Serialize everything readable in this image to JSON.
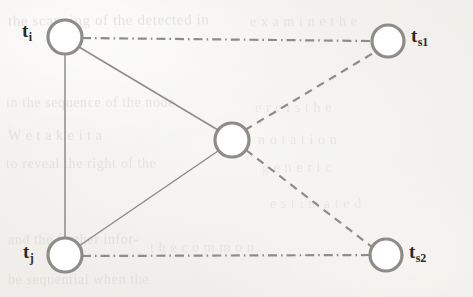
{
  "figure": {
    "type": "node-link-diagram",
    "caption_present": false,
    "background_color": "#f4f3f0",
    "stroke_color": "#8d8c89",
    "node_fill_color": "#ffffff",
    "label_color": "#2b2b2b",
    "width": 473,
    "height": 297
  },
  "nodes": [
    {
      "id": "t_i",
      "label_base": "t",
      "label_sub": "i",
      "label_text": "ti",
      "label_position": "left",
      "cx": 65,
      "cy": 37,
      "r": 17,
      "label_x": 22,
      "label_y": 21
    },
    {
      "id": "t_s1",
      "label_base": "t",
      "label_sub": "s1",
      "label_text": "ts1",
      "label_position": "right",
      "cx": 388,
      "cy": 41,
      "r": 16,
      "label_x": 411,
      "label_y": 26
    },
    {
      "id": "t_j",
      "label_base": "t",
      "label_sub": "j",
      "label_text": "tj",
      "label_position": "left",
      "cx": 65,
      "cy": 255,
      "r": 17,
      "label_x": 23,
      "label_y": 242
    },
    {
      "id": "t_s2",
      "label_base": "t",
      "label_sub": "s2",
      "label_text": "ts2",
      "label_position": "right",
      "cx": 386,
      "cy": 255,
      "r": 16,
      "label_x": 409,
      "label_y": 242
    },
    {
      "id": "center",
      "label_base": "",
      "label_sub": "",
      "label_text": "",
      "label_position": "none",
      "cx": 232,
      "cy": 140,
      "r": 17,
      "label_x": 0,
      "label_y": 0
    }
  ],
  "edges": [
    {
      "id": "edge-ti-tj",
      "from": "t_i",
      "to": "t_j",
      "style": "solid",
      "x1": 65,
      "y1": 54,
      "x2": 65,
      "y2": 238
    },
    {
      "id": "edge-ti-center",
      "from": "t_i",
      "to": "center",
      "style": "solid",
      "x1": 79,
      "y1": 47,
      "x2": 218,
      "y2": 130
    },
    {
      "id": "edge-tj-center",
      "from": "t_j",
      "to": "center",
      "style": "solid",
      "x1": 79,
      "y1": 246,
      "x2": 218,
      "y2": 151
    },
    {
      "id": "edge-ti-ts1",
      "from": "t_i",
      "to": "t_s1",
      "style": "dash-dot",
      "x1": 82,
      "y1": 38,
      "x2": 372,
      "y2": 41
    },
    {
      "id": "edge-tj-ts2",
      "from": "t_j",
      "to": "t_s2",
      "style": "dash-dot",
      "x1": 82,
      "y1": 256,
      "x2": 370,
      "y2": 255
    },
    {
      "id": "edge-center-ts1",
      "from": "center",
      "to": "t_s1",
      "style": "dashed",
      "x1": 245,
      "y1": 130,
      "x2": 375,
      "y2": 52
    },
    {
      "id": "edge-center-ts2",
      "from": "center",
      "to": "t_s2",
      "style": "dashed",
      "x1": 246,
      "y1": 150,
      "x2": 372,
      "y2": 247
    }
  ],
  "background_bleed_text": [
    {
      "text": "the scanning of the detected in",
      "x": 8,
      "y": 12,
      "size": 15,
      "rotate": -0.4,
      "opacity": 0.45
    },
    {
      "text": "e  x  a  m  i  n  e   t  h  e",
      "x": 250,
      "y": 14,
      "size": 14,
      "rotate": -0.3,
      "opacity": 0.35
    },
    {
      "text": "in the sequence of the node",
      "x": 6,
      "y": 95,
      "size": 14,
      "rotate": -0.2,
      "opacity": 0.4
    },
    {
      "text": "e  r  e   i  s   t  h  e",
      "x": 255,
      "y": 100,
      "size": 14,
      "rotate": -0.2,
      "opacity": 0.3
    },
    {
      "text": "W  e   t  a  k  e   i  t   a",
      "x": 8,
      "y": 128,
      "size": 14,
      "rotate": -0.3,
      "opacity": 0.42
    },
    {
      "text": "n  o  t  a  t  i  o  n",
      "x": 258,
      "y": 132,
      "size": 14,
      "rotate": -0.2,
      "opacity": 0.33
    },
    {
      "text": "to reveal the right of the",
      "x": 6,
      "y": 156,
      "size": 14,
      "rotate": -0.2,
      "opacity": 0.4
    },
    {
      "text": "g   e   n   e   r   i   c",
      "x": 262,
      "y": 160,
      "size": 14,
      "rotate": -0.2,
      "opacity": 0.3
    },
    {
      "text": "e  s  t  i  m  a  t  e  d",
      "x": 270,
      "y": 196,
      "size": 14,
      "rotate": -0.2,
      "opacity": 0.28
    },
    {
      "text": "and the further infor-",
      "x": 8,
      "y": 232,
      "size": 14,
      "rotate": -0.3,
      "opacity": 0.42
    },
    {
      "text": "t  h  e   c  o  m  m  o  n",
      "x": 150,
      "y": 240,
      "size": 14,
      "rotate": -0.2,
      "opacity": 0.33
    },
    {
      "text": "be  sequential  when the",
      "x": 8,
      "y": 272,
      "size": 14,
      "rotate": -0.2,
      "opacity": 0.38
    }
  ]
}
